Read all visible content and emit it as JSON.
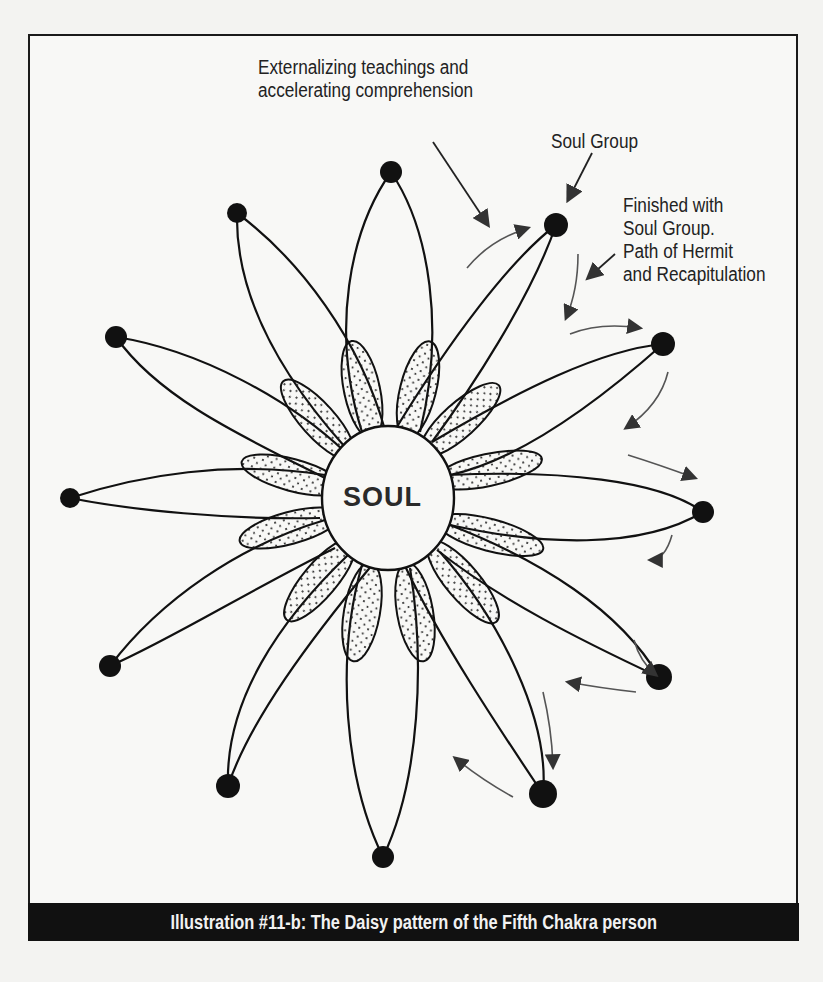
{
  "figure": {
    "caption": "Illustration #11-b: The Daisy pattern of the Fifth Chakra person",
    "center_label": "SOUL",
    "annotations": {
      "externalizing": [
        "Externalizing teachings and",
        "accelerating comprehension"
      ],
      "soul_group": "Soul Group",
      "finished": [
        "Finished with",
        "Soul Group.",
        "Path of Hermit",
        "and Recapitulation"
      ]
    },
    "petal_count": 12,
    "colors": {
      "ink": "#111111",
      "paper": "#f8f8f6",
      "caption_bg": "#111111",
      "caption_text": "#f2f2f2",
      "arrow": "#555555"
    }
  }
}
